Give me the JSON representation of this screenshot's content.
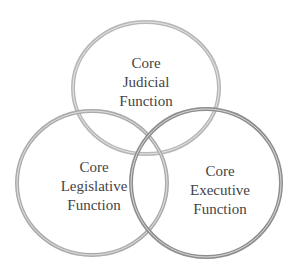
{
  "diagram": {
    "type": "venn",
    "circles": [
      {
        "id": "judicial",
        "lines": [
          "Core",
          "Judicial",
          "Function"
        ],
        "stroke": "#b5b5b5"
      },
      {
        "id": "legislative",
        "lines": [
          "Core",
          "Legislative",
          "Function"
        ],
        "stroke": "#a9a9a9"
      },
      {
        "id": "executive",
        "lines": [
          "Core",
          "Executive",
          "Function"
        ],
        "stroke": "#8c8c8c"
      }
    ]
  }
}
